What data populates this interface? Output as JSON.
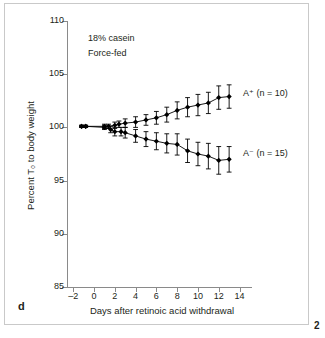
{
  "panel": {
    "letter": "d",
    "page_number": "2"
  },
  "chart_data": {
    "type": "line",
    "title": "",
    "xlabel": "Days after retinoic acid withdrawal",
    "ylabel": "Percent T₀ to body weight",
    "xlim": [
      -2.6,
      15.2
    ],
    "ylim": [
      85,
      110
    ],
    "xticks": [
      -2,
      0,
      2,
      4,
      6,
      8,
      10,
      12,
      14
    ],
    "xticklabels": [
      "–2",
      "0",
      "2",
      "4",
      "6",
      "8",
      "10",
      "12",
      "14"
    ],
    "yticks": [
      85,
      90,
      95,
      100,
      105,
      110
    ],
    "yticklabels": [
      "85",
      "90",
      "95",
      "100",
      "105",
      "110"
    ],
    "grid": false,
    "legend_position": "inline-right",
    "annotations": [
      "18% casein",
      "Force-fed"
    ],
    "series": [
      {
        "name": "A⁺ (n = 10)",
        "label": "A⁺ (n = 10)",
        "marker": "filled-diamond",
        "color": "#000000",
        "x": [
          -1.2,
          -0.8,
          1.0,
          1.4,
          2.0,
          2.4,
          3.0,
          4.0,
          5.0,
          6.0,
          7.0,
          8.0,
          9.0,
          10.0,
          11.0,
          12.0,
          13.0
        ],
        "values": [
          100.1,
          100.1,
          100.1,
          100.1,
          100.2,
          100.3,
          100.4,
          100.5,
          100.7,
          100.9,
          101.2,
          101.6,
          101.9,
          102.1,
          102.3,
          102.8,
          102.9
        ],
        "err": [
          0.1,
          0.1,
          0.2,
          0.2,
          0.3,
          0.3,
          0.4,
          0.5,
          0.5,
          0.6,
          0.7,
          0.8,
          0.9,
          1.0,
          1.0,
          1.1,
          1.1
        ]
      },
      {
        "name": "A⁻ (n = 15)",
        "label": "A⁻ (n = 15)",
        "marker": "filled-diamond",
        "color": "#000000",
        "x": [
          -1.2,
          -0.8,
          1.0,
          1.6,
          2.0,
          2.6,
          3.0,
          4.0,
          5.0,
          6.0,
          7.0,
          8.0,
          9.0,
          10.0,
          11.0,
          12.0,
          13.0
        ],
        "values": [
          100.1,
          100.1,
          100.0,
          99.8,
          99.6,
          99.6,
          99.5,
          99.2,
          98.9,
          98.7,
          98.5,
          98.4,
          97.8,
          97.5,
          97.3,
          96.9,
          97.0
        ],
        "err": [
          0.1,
          0.1,
          0.2,
          0.3,
          0.4,
          0.4,
          0.5,
          0.6,
          0.7,
          0.8,
          0.9,
          1.0,
          1.1,
          1.1,
          1.2,
          1.3,
          1.2
        ]
      }
    ]
  }
}
